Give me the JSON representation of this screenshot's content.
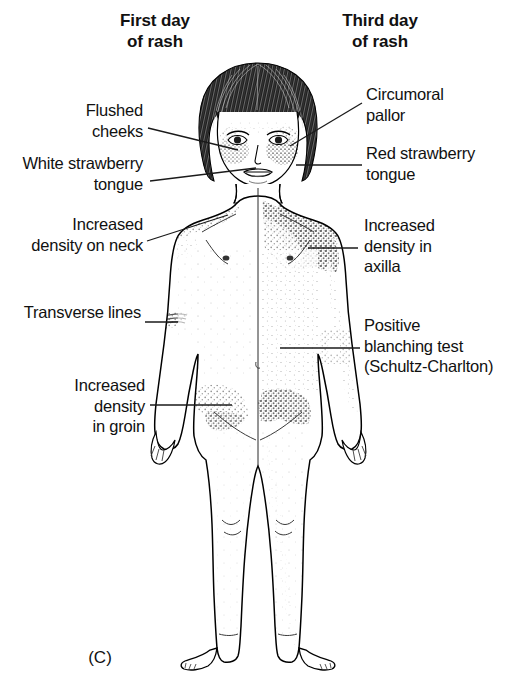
{
  "figure": {
    "caption": "(C)",
    "background_color": "#ffffff",
    "ink_color": "#111111"
  },
  "headers": [
    {
      "id": "first-day",
      "line1": "First day",
      "line2": "of rash",
      "side": "left"
    },
    {
      "id": "third-day",
      "line1": "Third day",
      "line2": "of rash",
      "side": "right"
    }
  ],
  "labels_left": [
    {
      "id": "flushed-cheeks",
      "text": "Flushed\ncheeks"
    },
    {
      "id": "white-strawberry-tongue",
      "text": "White strawberry\ntongue"
    },
    {
      "id": "increased-density-neck",
      "text": "Increased\ndensity on neck"
    },
    {
      "id": "transverse-lines",
      "text": "Transverse lines"
    },
    {
      "id": "increased-density-groin",
      "text": "Increased\ndensity\nin groin"
    }
  ],
  "labels_right": [
    {
      "id": "circumoral-pallor",
      "text": "Circumoral\npallor"
    },
    {
      "id": "red-strawberry-tongue",
      "text": "Red strawberry\ntongue"
    },
    {
      "id": "increased-density-axilla",
      "text": "Increased\ndensity in\naxilla"
    },
    {
      "id": "positive-blanching-test",
      "text": "Positive\nblanching test\n(Schultz-Charlton)"
    }
  ]
}
